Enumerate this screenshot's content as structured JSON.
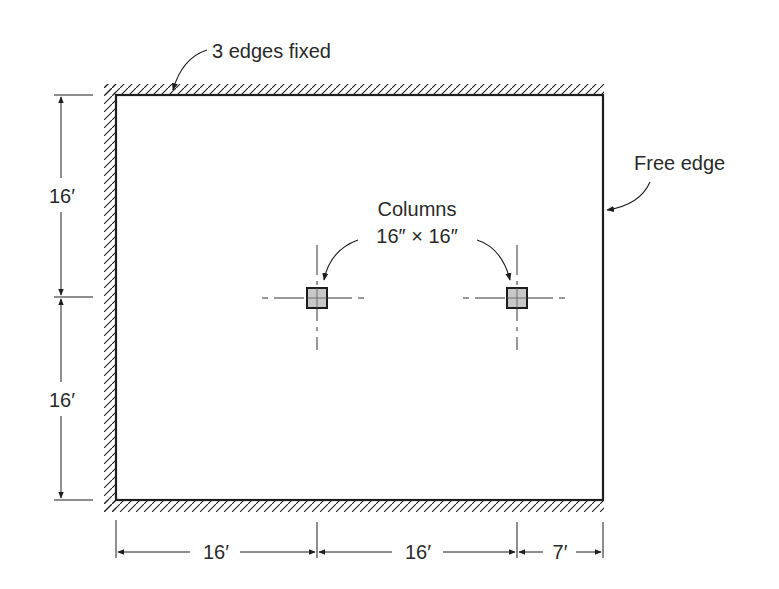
{
  "diagram": {
    "type": "structural-slab-plan",
    "colors": {
      "line": "#1e1e1e",
      "text": "#2a2a2a",
      "column_fill": "#c8c8c8",
      "background": "#ffffff"
    },
    "annotations": {
      "fixed_edges": "3 edges fixed",
      "free_edge": "Free edge",
      "columns_line1": "Columns",
      "columns_line2": "16″ × 16″"
    },
    "dimensions": {
      "vertical": [
        "16′",
        "16′"
      ],
      "horizontal": [
        "16′",
        "16′",
        "7′"
      ]
    },
    "columns": [
      {
        "id": "column-1",
        "size": "16″ × 16″"
      },
      {
        "id": "column-2",
        "size": "16″ × 16″"
      }
    ]
  }
}
